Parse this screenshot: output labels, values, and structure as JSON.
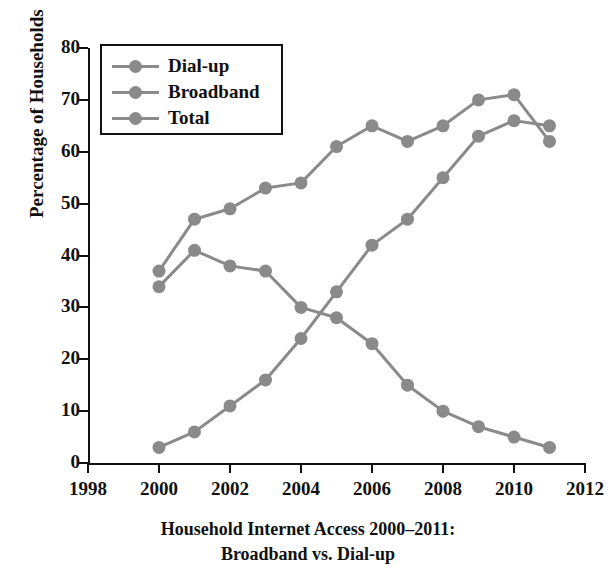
{
  "title": "Internet Access",
  "caption_line1": "Household Internet Access 2000–2011:",
  "caption_line2": "Broadband vs. Dial-up",
  "legend": {
    "items": [
      {
        "label": "Dial-up"
      },
      {
        "label": "Broadband"
      },
      {
        "label": "Total"
      }
    ]
  },
  "chart_data": {
    "type": "line",
    "title": "Internet Access",
    "xlabel": "",
    "ylabel": "Percentage of Households",
    "xlim": [
      1998,
      2012
    ],
    "ylim": [
      0,
      80
    ],
    "xticks": [
      1998,
      2000,
      2002,
      2004,
      2006,
      2008,
      2010,
      2012
    ],
    "yticks": [
      0,
      10,
      20,
      30,
      40,
      50,
      60,
      70,
      80
    ],
    "grid": false,
    "legend_position": "upper left",
    "marker": "circle",
    "series_color": "#8a8a8a",
    "x": [
      2000,
      2001,
      2002,
      2003,
      2004,
      2005,
      2006,
      2007,
      2008,
      2009,
      2010,
      2011
    ],
    "series": [
      {
        "name": "Dial-up",
        "values": [
          34,
          41,
          38,
          37,
          30,
          28,
          23,
          15,
          10,
          7,
          5,
          3
        ]
      },
      {
        "name": "Broadband",
        "values": [
          3,
          6,
          11,
          16,
          24,
          33,
          42,
          47,
          55,
          63,
          66,
          65
        ]
      },
      {
        "name": "Total",
        "values": [
          37,
          47,
          49,
          53,
          54,
          61,
          65,
          62,
          65,
          70,
          71,
          62
        ]
      }
    ]
  }
}
